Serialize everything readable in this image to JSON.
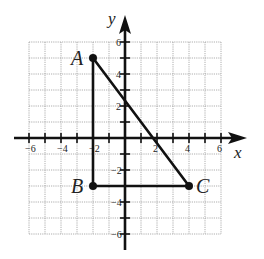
{
  "figure": {
    "type": "coordinate-plane-triangle",
    "x_axis_label": "x",
    "y_axis_label": "y",
    "x_ticks": [
      {
        "value": -6,
        "label": "-6"
      },
      {
        "value": -4,
        "label": "-4"
      },
      {
        "value": -2,
        "label": "-2"
      },
      {
        "value": 2,
        "label": "2"
      },
      {
        "value": 4,
        "label": "4"
      },
      {
        "value": 6,
        "label": "6"
      }
    ],
    "y_ticks": [
      {
        "value": 6,
        "label": "6"
      },
      {
        "value": 4,
        "label": "4"
      },
      {
        "value": 2,
        "label": "2"
      },
      {
        "value": -2,
        "label": "-2"
      },
      {
        "value": -4,
        "label": "-4"
      },
      {
        "value": -6,
        "label": "-6"
      }
    ],
    "grid": {
      "xmin": -6,
      "xmax": 6,
      "ymin": -6,
      "ymax": 6,
      "step": 1
    },
    "points": [
      {
        "label": "A",
        "x": -2,
        "y": 5
      },
      {
        "label": "B",
        "x": -2,
        "y": -3
      },
      {
        "label": "C",
        "x": 4,
        "y": -3
      }
    ],
    "segments": [
      [
        "A",
        "B"
      ],
      [
        "B",
        "C"
      ],
      [
        "C",
        "A"
      ]
    ],
    "colors": {
      "line": "#111111",
      "grid": "#9a9a9a",
      "background": "#ffffff"
    }
  }
}
